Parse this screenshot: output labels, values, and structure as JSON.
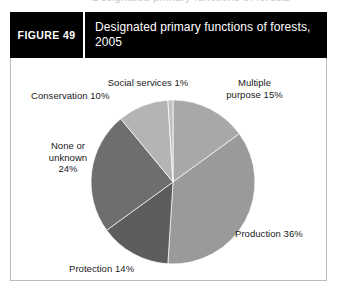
{
  "bleed_top_text": "Designated primary functions of forests",
  "figure": {
    "number_label": "FIGURE 49",
    "title": "Designated primary functions of forests, 2005"
  },
  "chart_data": {
    "type": "pie",
    "title": "Designated primary functions of forests, 2005",
    "xlabel": "",
    "ylabel": "",
    "legend_position": "none",
    "grid": false,
    "start_angle_deg": 0,
    "direction": "clockwise",
    "categories": [
      "Multiple purpose",
      "Production",
      "Protection",
      "None or unknown",
      "Conservation",
      "Social services"
    ],
    "values": [
      15,
      36,
      14,
      24,
      10,
      1
    ],
    "unit": "%",
    "colors": [
      "#a8a8a8",
      "#9a9a9a",
      "#5d5d5d",
      "#6e6e6e",
      "#b4b4b4",
      "#c2c2c2"
    ],
    "labels": [
      {
        "key": "multiple",
        "text": "Multiple\npurpose 15%",
        "name": "Multiple purpose",
        "value": 15
      },
      {
        "key": "production",
        "text": "Production 36%",
        "name": "Production",
        "value": 36
      },
      {
        "key": "protection",
        "text": "Protection 14%",
        "name": "Protection",
        "value": 14
      },
      {
        "key": "none",
        "text": "None or\nunknown\n24%",
        "name": "None or unknown",
        "value": 24
      },
      {
        "key": "conservation",
        "text": "Conservation 10%",
        "name": "Conservation",
        "value": 10
      },
      {
        "key": "social",
        "text": "Social services 1%",
        "name": "Social services",
        "value": 1
      }
    ]
  }
}
